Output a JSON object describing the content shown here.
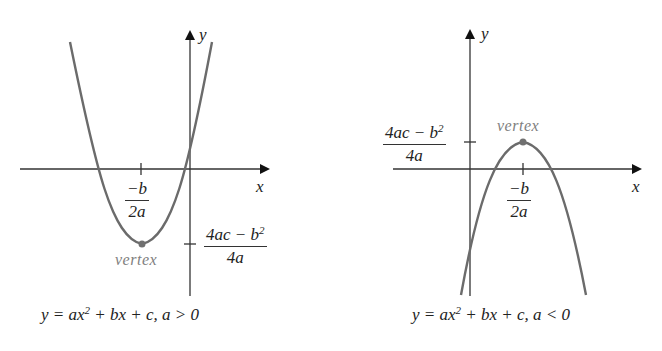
{
  "panels": [
    {
      "id": "upward",
      "axes": {
        "x_label": "x",
        "y_label": "y"
      },
      "x_tick": {
        "numerator": "−b",
        "denominator": "2a"
      },
      "y_tick": {
        "numerator": "4ac − b",
        "numerator_sup": "2",
        "denominator": "4a"
      },
      "vertex_label": "vertex",
      "caption": {
        "lhs": "y = ax",
        "sup": "2",
        "rhs": " + bx + c, a > 0"
      },
      "curve_color": "#6b6b6b",
      "vertex_color": "#707070"
    },
    {
      "id": "downward",
      "axes": {
        "x_label": "x",
        "y_label": "y"
      },
      "x_tick": {
        "numerator": "−b",
        "denominator": "2a"
      },
      "y_tick": {
        "numerator": "4ac − b",
        "numerator_sup": "2",
        "denominator": "4a"
      },
      "vertex_label": "vertex",
      "caption": {
        "lhs": "y = ax",
        "sup": "2",
        "rhs": " + bx + c, a < 0"
      },
      "curve_color": "#6b6b6b",
      "vertex_color": "#707070"
    }
  ]
}
